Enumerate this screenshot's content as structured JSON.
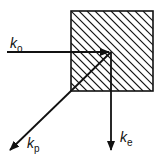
{
  "diagram": {
    "labels": {
      "k_o": {
        "base": "k",
        "sub": "o"
      },
      "k_p": {
        "base": "k",
        "sub": "p"
      },
      "k_e": {
        "base": "k",
        "sub": "e"
      }
    },
    "colors": {
      "stroke": "#111111",
      "background": "#ffffff"
    }
  }
}
